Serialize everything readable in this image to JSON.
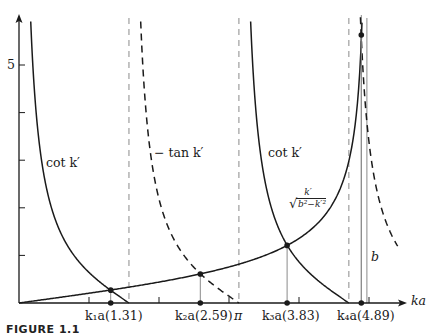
{
  "chart_data": {
    "type": "line",
    "title": "",
    "xlabel": "ka",
    "ylabel": "",
    "xlim": [
      0,
      5.5
    ],
    "ylim": [
      0,
      6
    ],
    "grid": false,
    "legend": "none (curves labeled inline)",
    "y_ticks": [
      1,
      2,
      3,
      4,
      5
    ],
    "y_tick_labels": [
      "",
      "",
      "",
      "",
      "5"
    ],
    "x_ticks": [
      1,
      2,
      3,
      4,
      5
    ],
    "b": 4.97,
    "series": [
      {
        "name": "cot k'",
        "style": "solid",
        "function": "cot(x)",
        "domain": [
          0,
          1.5708
        ]
      },
      {
        "name": "−tan k'",
        "style": "dashed",
        "function": "-tan(x)",
        "domain": [
          1.5708,
          3.1416
        ]
      },
      {
        "name": "cot k'",
        "style": "solid",
        "function": "cot(x)",
        "domain": [
          3.1416,
          4.7124
        ]
      },
      {
        "name": "−tan k'",
        "style": "dashed",
        "function": "-tan(x)",
        "domain": [
          4.7124,
          5.41
        ]
      },
      {
        "name": "k'/√(b²−k'²)",
        "style": "solid",
        "function": "x/sqrt(b^2-x^2)",
        "domain": [
          0,
          4.9
        ]
      }
    ],
    "asymptotes": [
      {
        "x": 1.5708,
        "style": "dashed-gray"
      },
      {
        "x": 3.1416,
        "style": "dashed-gray",
        "label": "π"
      },
      {
        "x": 4.7124,
        "style": "dashed-gray"
      },
      {
        "x": 4.97,
        "style": "solid-gray",
        "label": "b"
      }
    ],
    "intersections": [
      {
        "label": "k₁a",
        "x": 1.31,
        "y": 0.27
      },
      {
        "label": "k₂a",
        "x": 2.59,
        "y": 0.61
      },
      {
        "label": "k₃a",
        "x": 3.83,
        "y": 1.21
      },
      {
        "label": "k₄a",
        "x": 4.89,
        "y": 5.63
      }
    ],
    "annotations": [
      "cot k'",
      "−tan k'",
      "cot k'",
      "k'/√(b²−k'²)",
      "b",
      "π"
    ]
  },
  "labels": {
    "y5": "5",
    "cot_left": "cot k′",
    "tan_mid": "− tan k′",
    "cot_right": "cot k′",
    "frac_num": "k′",
    "frac_den": "b²−k′²",
    "b": "b",
    "pi": "π",
    "xaxis": "ka",
    "k1": "k₁a(1.31)",
    "k2": "k₂a(2.59)",
    "k3": "k₃a(3.83)",
    "k4": "k₄a(4.89)",
    "caption": "FIGURE 1.1"
  },
  "colors": {
    "curve": "#1a1a1a",
    "asymptote": "#8a8a8a",
    "axis": "#1a1a1a",
    "background": "#ffffff"
  }
}
